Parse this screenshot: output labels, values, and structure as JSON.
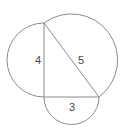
{
  "diagram": {
    "colors": {
      "stroke": "#8c8c8c",
      "text": "#4a4a4a",
      "background": "#ffffff"
    },
    "vertices": {
      "top": [
        44,
        23
      ],
      "right_angle": [
        44,
        97
      ],
      "bottom_right": [
        99,
        97
      ]
    },
    "sides": [
      {
        "id": "vertical",
        "label": "4",
        "label_pos": [
          38,
          64
        ]
      },
      {
        "id": "hypotenuse",
        "label": "5",
        "label_pos": [
          81,
          64
        ]
      },
      {
        "id": "base",
        "label": "3",
        "label_pos": [
          72,
          111
        ]
      }
    ]
  }
}
